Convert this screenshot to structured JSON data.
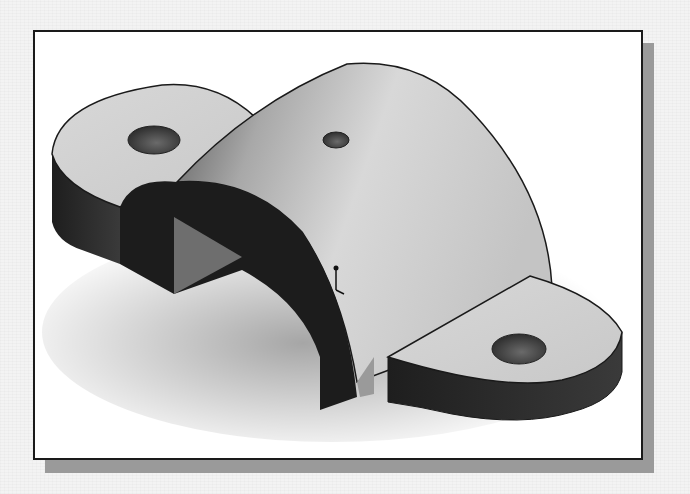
{
  "figure": {
    "subject": "3D solid model of a pipe clamp / saddle bracket",
    "features": {
      "flanges": 2,
      "flange_holes": 2,
      "top_hole": 1,
      "origin_triad_marker": true
    },
    "colors": {
      "background": "#f3f3f3",
      "frame_fill": "#ffffff",
      "frame_border": "#1a1a1a",
      "frame_shadow": "#9a9a9a",
      "top_face": "#d4d4d4",
      "side_face_dark": "#2c2c2c",
      "arch_shadow": "#1c1c1c",
      "triangle_face": "#6e6e6e",
      "hole_fill": "#4a4a4a"
    }
  }
}
